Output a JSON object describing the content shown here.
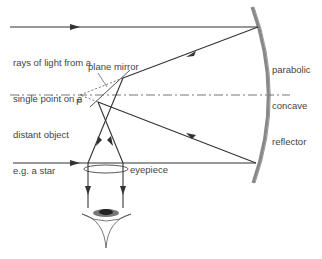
{
  "diagram": {
    "labels": {
      "rays": [
        "rays of light from a",
        "single point on a",
        "distant object",
        "e.g. a star"
      ],
      "plane_mirror": "plane mirror",
      "focus": "F",
      "reflector": [
        "parabolic",
        "concave",
        "reflector"
      ],
      "eyepiece": "eyepiece"
    },
    "colors": {
      "ray": "#333333",
      "mirror": "#777777",
      "axis": "#666666",
      "text": "#444444",
      "eye_iris": "#555555"
    }
  }
}
